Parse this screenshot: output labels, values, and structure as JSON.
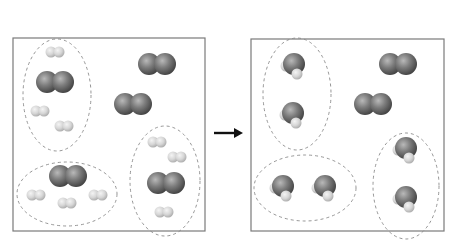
{
  "caption": "",
  "diagram": {
    "type": "reaction-particle-diagram",
    "reaction": "2 H2 + O2 → 2 H2O",
    "arrow": "right-arrow",
    "panels": [
      {
        "name": "reactants",
        "box": {
          "x": 13,
          "y": 38,
          "w": 192,
          "h": 193
        },
        "groups": [
          {
            "ellipse": {
              "cx": 57,
              "cy": 95,
              "rx": 34,
              "ry": 56
            },
            "molecules": [
              {
                "type": "H2",
                "x": 55,
                "y": 52
              },
              {
                "type": "O2",
                "x": 55,
                "y": 82
              },
              {
                "type": "H2",
                "x": 40,
                "y": 111
              },
              {
                "type": "H2",
                "x": 64,
                "y": 126
              }
            ]
          },
          {
            "ellipse": {
              "cx": 67,
              "cy": 194,
              "rx": 50,
              "ry": 32
            },
            "molecules": [
              {
                "type": "O2",
                "x": 68,
                "y": 176
              },
              {
                "type": "H2",
                "x": 36,
                "y": 195
              },
              {
                "type": "H2",
                "x": 67,
                "y": 203
              },
              {
                "type": "H2",
                "x": 98,
                "y": 195
              }
            ]
          },
          {
            "ellipse": {
              "cx": 165,
              "cy": 181,
              "rx": 35,
              "ry": 55
            },
            "molecules": [
              {
                "type": "H2",
                "x": 157,
                "y": 142
              },
              {
                "type": "H2",
                "x": 177,
                "y": 157
              },
              {
                "type": "O2",
                "x": 166,
                "y": 183
              },
              {
                "type": "H2",
                "x": 164,
                "y": 212
              }
            ]
          }
        ],
        "free_molecules": [
          {
            "type": "O2",
            "x": 157,
            "y": 64
          },
          {
            "type": "O2",
            "x": 133,
            "y": 104
          }
        ]
      },
      {
        "name": "products",
        "box": {
          "x": 251,
          "y": 39,
          "w": 193,
          "h": 192
        },
        "groups": [
          {
            "ellipse": {
              "cx": 297,
              "cy": 94,
              "rx": 34,
              "ry": 56
            },
            "molecules": [
              {
                "type": "H2O",
                "x": 294,
                "y": 64
              },
              {
                "type": "H2O",
                "x": 293,
                "y": 113
              }
            ]
          },
          {
            "ellipse": {
              "cx": 305,
              "cy": 188,
              "rx": 51,
              "ry": 33
            },
            "molecules": [
              {
                "type": "H2O",
                "x": 283,
                "y": 186
              },
              {
                "type": "H2O",
                "x": 325,
                "y": 186
              }
            ]
          },
          {
            "ellipse": {
              "cx": 406,
              "cy": 186,
              "rx": 33,
              "ry": 53
            },
            "molecules": [
              {
                "type": "H2O",
                "x": 406,
                "y": 148
              },
              {
                "type": "H2O",
                "x": 406,
                "y": 197
              }
            ]
          }
        ],
        "free_molecules": [
          {
            "type": "O2",
            "x": 398,
            "y": 64
          },
          {
            "type": "O2",
            "x": 373,
            "y": 104
          }
        ]
      }
    ],
    "colors": {
      "box_border": "#7a7a7a",
      "ellipse_dash": "#8a8a8a",
      "oxygen": "#6e6e6e",
      "hydrogen": "#d4d4d4",
      "arrow": "#111111"
    }
  }
}
